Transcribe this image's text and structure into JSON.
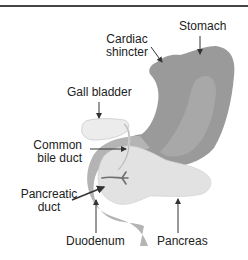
{
  "diagram": {
    "labels": {
      "stomach": "Stomach",
      "cardiac_line1": "Cardiac",
      "cardiac_line2": "shincter",
      "gall_bladder": "Gall bladder",
      "common_bile_line1": "Common",
      "common_bile_line2": "bile duct",
      "pancreatic_line1": "Pancreatic",
      "pancreatic_line2": "duct",
      "duodenum": "Duodenum",
      "pancreas": "Pancreas"
    },
    "colors": {
      "stomach": "#9a9a9a",
      "stomach_highlight": "#a8a8a8",
      "duodenum": "#b4b4b4",
      "pancreas": "#e2e2e2",
      "gall_bladder": "#ececec",
      "duct": "#6e6e6e",
      "arrow": "#333333",
      "frame": "#444444"
    }
  }
}
